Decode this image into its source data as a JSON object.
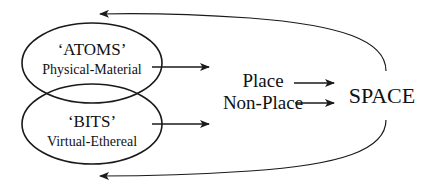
{
  "diagram": {
    "atoms": {
      "title": "‘ATOMS’",
      "subtitle": "Physical-Material"
    },
    "bits": {
      "title": "‘BITS’",
      "subtitle": "Virtual-Ethereal"
    },
    "middle": {
      "place": "Place",
      "non_place": "Non-Place"
    },
    "target": {
      "label": "SPACE"
    },
    "colors": {
      "stroke": "#1a1a1a",
      "text": "#111111",
      "background": "#ffffff"
    }
  }
}
